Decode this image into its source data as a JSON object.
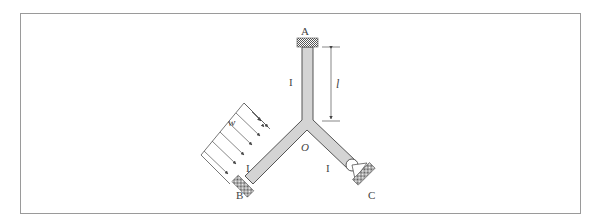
{
  "figure": {
    "type": "structural-frame",
    "labels": {
      "A": "A",
      "B": "B",
      "C": "C",
      "O": "O",
      "length": "l",
      "load": "w",
      "inertia_vertical": "I",
      "inertia_left": "I",
      "inertia_right": "I"
    },
    "supports": {
      "A": "fixed",
      "B": "fixed",
      "C": "pin"
    },
    "colors": {
      "member_fill": "#d4d4d4",
      "member_stroke": "#555555",
      "border": "#9a9a9a",
      "text": "#444444"
    }
  }
}
